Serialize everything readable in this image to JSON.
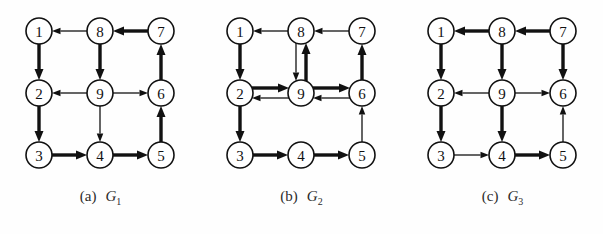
{
  "figure": {
    "background_color": "#fefefe",
    "stroke_color": "#111111",
    "node_fill": "#ffffff"
  },
  "layout": {
    "node_radius": 13,
    "columns_x": [
      39,
      100,
      161
    ],
    "rows_y": [
      31,
      93,
      155
    ],
    "panel_width": 201,
    "panel_height": 234
  },
  "nodes": [
    {
      "id": "1",
      "label": "1",
      "col": 0,
      "row": 0
    },
    {
      "id": "8",
      "label": "8",
      "col": 1,
      "row": 0
    },
    {
      "id": "7",
      "label": "7",
      "col": 2,
      "row": 0
    },
    {
      "id": "2",
      "label": "2",
      "col": 0,
      "row": 1
    },
    {
      "id": "9",
      "label": "9",
      "col": 1,
      "row": 1
    },
    {
      "id": "6",
      "label": "6",
      "col": 2,
      "row": 1
    },
    {
      "id": "3",
      "label": "3",
      "col": 0,
      "row": 2
    },
    {
      "id": "4",
      "label": "4",
      "col": 1,
      "row": 2
    },
    {
      "id": "5",
      "label": "5",
      "col": 2,
      "row": 2
    }
  ],
  "panels": [
    {
      "key": "a",
      "caption_tag": "(a)",
      "caption_name": "G",
      "caption_sub": "1",
      "graph_name": "G1",
      "edges": [
        {
          "from": "8",
          "to": "1",
          "weight": "thin"
        },
        {
          "from": "7",
          "to": "8",
          "weight": "thick"
        },
        {
          "from": "1",
          "to": "2",
          "weight": "thick"
        },
        {
          "from": "8",
          "to": "9",
          "weight": "thick"
        },
        {
          "from": "6",
          "to": "7",
          "weight": "thick"
        },
        {
          "from": "9",
          "to": "2",
          "weight": "thin"
        },
        {
          "from": "9",
          "to": "6",
          "weight": "thin"
        },
        {
          "from": "2",
          "to": "3",
          "weight": "thick"
        },
        {
          "from": "9",
          "to": "4",
          "weight": "thin"
        },
        {
          "from": "5",
          "to": "6",
          "weight": "thick"
        },
        {
          "from": "3",
          "to": "4",
          "weight": "thick"
        },
        {
          "from": "4",
          "to": "5",
          "weight": "thick"
        }
      ]
    },
    {
      "key": "b",
      "caption_tag": "(b)",
      "caption_name": "G",
      "caption_sub": "2",
      "graph_name": "G2",
      "edges": [
        {
          "from": "8",
          "to": "1",
          "weight": "thin"
        },
        {
          "from": "7",
          "to": "8",
          "weight": "thin"
        },
        {
          "from": "1",
          "to": "2",
          "weight": "thick"
        },
        {
          "from": "8",
          "to": "9",
          "weight": "thin",
          "offset": "left"
        },
        {
          "from": "9",
          "to": "8",
          "weight": "thick",
          "offset": "right"
        },
        {
          "from": "6",
          "to": "7",
          "weight": "thick"
        },
        {
          "from": "2",
          "to": "9",
          "weight": "thick",
          "offset": "up"
        },
        {
          "from": "9",
          "to": "2",
          "weight": "thin",
          "offset": "down"
        },
        {
          "from": "9",
          "to": "6",
          "weight": "thick",
          "offset": "up"
        },
        {
          "from": "6",
          "to": "9",
          "weight": "thin",
          "offset": "down"
        },
        {
          "from": "2",
          "to": "3",
          "weight": "thick"
        },
        {
          "from": "5",
          "to": "6",
          "weight": "thin"
        },
        {
          "from": "3",
          "to": "4",
          "weight": "thick"
        },
        {
          "from": "4",
          "to": "5",
          "weight": "thick"
        }
      ]
    },
    {
      "key": "c",
      "caption_tag": "(c)",
      "caption_name": "G",
      "caption_sub": "3",
      "graph_name": "G3",
      "edges": [
        {
          "from": "8",
          "to": "1",
          "weight": "thick"
        },
        {
          "from": "7",
          "to": "8",
          "weight": "thick"
        },
        {
          "from": "1",
          "to": "2",
          "weight": "thick"
        },
        {
          "from": "8",
          "to": "9",
          "weight": "thick"
        },
        {
          "from": "7",
          "to": "6",
          "weight": "thick"
        },
        {
          "from": "9",
          "to": "2",
          "weight": "thin"
        },
        {
          "from": "9",
          "to": "6",
          "weight": "thin"
        },
        {
          "from": "2",
          "to": "3",
          "weight": "thick"
        },
        {
          "from": "9",
          "to": "4",
          "weight": "thick"
        },
        {
          "from": "5",
          "to": "6",
          "weight": "thin"
        },
        {
          "from": "3",
          "to": "4",
          "weight": "thin"
        },
        {
          "from": "4",
          "to": "5",
          "weight": "thick"
        }
      ]
    }
  ]
}
